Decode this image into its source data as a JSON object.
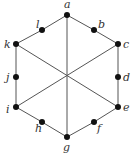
{
  "diagram": {
    "type": "graph",
    "colors": {
      "edge": "#555555",
      "node": "#111111",
      "label": "#333333",
      "background": "#ffffff"
    },
    "nodes": [
      {
        "id": "a",
        "label": "a",
        "x": 67,
        "y": 15,
        "lx": 64,
        "ly": 8
      },
      {
        "id": "b",
        "label": "b",
        "x": 94,
        "y": 30,
        "lx": 98,
        "ly": 28
      },
      {
        "id": "c",
        "label": "c",
        "x": 118,
        "y": 44,
        "lx": 123,
        "ly": 48
      },
      {
        "id": "d",
        "label": "d",
        "x": 118,
        "y": 77,
        "lx": 123,
        "ly": 81
      },
      {
        "id": "e",
        "label": "e",
        "x": 118,
        "y": 107,
        "lx": 123,
        "ly": 111
      },
      {
        "id": "f",
        "label": "f",
        "x": 94,
        "y": 122,
        "lx": 97,
        "ly": 132
      },
      {
        "id": "g",
        "label": "g",
        "x": 67,
        "y": 137,
        "lx": 63,
        "ly": 151
      },
      {
        "id": "h",
        "label": "h",
        "x": 42,
        "y": 122,
        "lx": 35,
        "ly": 132
      },
      {
        "id": "i",
        "label": "i",
        "x": 16,
        "y": 107,
        "lx": 6,
        "ly": 113
      },
      {
        "id": "j",
        "label": "j",
        "x": 16,
        "y": 77,
        "lx": 6,
        "ly": 81
      },
      {
        "id": "k",
        "label": "k",
        "x": 16,
        "y": 44,
        "lx": 4,
        "ly": 48
      },
      {
        "id": "l",
        "label": "l",
        "x": 42,
        "y": 30,
        "lx": 36,
        "ly": 28
      }
    ],
    "edges": [
      [
        "a",
        "b"
      ],
      [
        "b",
        "c"
      ],
      [
        "c",
        "d"
      ],
      [
        "d",
        "e"
      ],
      [
        "e",
        "f"
      ],
      [
        "f",
        "g"
      ],
      [
        "g",
        "h"
      ],
      [
        "h",
        "i"
      ],
      [
        "i",
        "j"
      ],
      [
        "j",
        "k"
      ],
      [
        "k",
        "l"
      ],
      [
        "l",
        "a"
      ],
      [
        "a",
        "g"
      ],
      [
        "k",
        "e"
      ],
      [
        "c",
        "i"
      ]
    ]
  }
}
